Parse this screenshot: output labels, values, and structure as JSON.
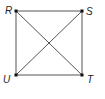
{
  "diagram": {
    "type": "geometry",
    "points": [
      {
        "name": "R",
        "x": 16,
        "y": 11,
        "label_x": 5,
        "label_y": 14
      },
      {
        "name": "S",
        "x": 82,
        "y": 11,
        "label_x": 86,
        "label_y": 15
      },
      {
        "name": "T",
        "x": 82,
        "y": 75,
        "label_x": 87,
        "label_y": 83
      },
      {
        "name": "U",
        "x": 16,
        "y": 75,
        "label_x": 3,
        "label_y": 83
      }
    ],
    "segments": [
      "RS",
      "ST",
      "TU",
      "UR",
      "RT",
      "SU"
    ],
    "colors": {
      "line": "#555555",
      "point": "#111111",
      "label": "#222222"
    }
  }
}
